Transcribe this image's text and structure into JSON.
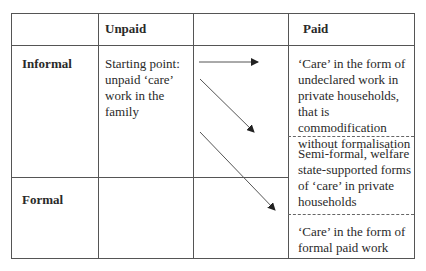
{
  "header": {
    "col_unpaid": "Unpaid",
    "col_paid": "Paid"
  },
  "rows": {
    "informal": "Informal",
    "formal": "Formal"
  },
  "cells": {
    "starting_point": "Starting point: unpaid ‘care’ work in the family",
    "undeclared": "‘Care’ in the form of undeclared work in private households, that is commodification without formalisation",
    "semi_formal": "Semi-formal, welfare state-supported forms of  ‘care’ in private households",
    "formal_paid": "‘Care’ in the form of formal paid work"
  },
  "arrows": [
    {
      "from": "starting-point",
      "to": "undeclared-work",
      "direction": "horizontal"
    },
    {
      "from": "starting-point",
      "to": "semi-formal",
      "direction": "diagonal"
    },
    {
      "from": "starting-point",
      "to": "formal-paid-work",
      "direction": "diagonal"
    }
  ],
  "colors": {
    "border": "#555555",
    "text": "#2a2a2a"
  }
}
